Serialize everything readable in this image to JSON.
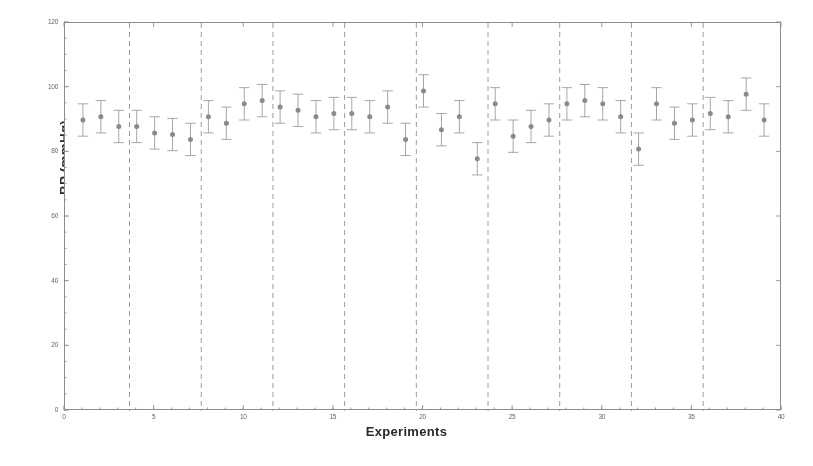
{
  "chart_data": {
    "type": "scatter",
    "title": "",
    "subtitle": "",
    "xlabel": "Experiments",
    "ylabel": "BP (mmHg)",
    "xlim": [
      0,
      40
    ],
    "ylim": [
      0,
      120
    ],
    "xticks": [
      0,
      5,
      10,
      15,
      20,
      25,
      30,
      35,
      40
    ],
    "yticks": [
      0,
      20,
      40,
      60,
      80,
      100,
      120
    ],
    "xtick_labels": [
      "0",
      "5",
      "10",
      "15",
      "20",
      "25",
      "30",
      "35",
      "40"
    ],
    "ytick_labels": [
      "0",
      "20",
      "40",
      "60",
      "80",
      "100",
      "120"
    ],
    "grid": false,
    "legend": null,
    "legend_position": "none",
    "marker": "filled-circle-with-errorbar",
    "marker_color": "#8a8a8a",
    "errorbar_color": "#9a9a9a",
    "group_divider_color": "#9a9a9a",
    "group_divider_style": "dashed",
    "group_dividers_x": [
      3.6,
      7.6,
      11.6,
      15.6,
      19.6,
      23.6,
      27.6,
      31.6,
      35.6
    ],
    "series": [
      {
        "name": "BP mean with error bars",
        "x": [
          1,
          2,
          3,
          4,
          5,
          6,
          7,
          8,
          9,
          10,
          11,
          12,
          13,
          14,
          15,
          16,
          17,
          18,
          19,
          20,
          21,
          22,
          23,
          24,
          25,
          26,
          27,
          28,
          29,
          30,
          31,
          32,
          33,
          34,
          35,
          36,
          37,
          38,
          39
        ],
        "values": [
          90,
          91,
          88,
          88,
          86,
          85.5,
          84,
          91,
          89,
          95,
          96,
          94,
          93,
          91,
          92,
          92,
          91,
          94,
          84,
          99,
          87,
          91,
          78,
          95,
          85,
          88,
          90,
          95,
          96,
          95,
          91,
          81,
          95,
          89,
          90,
          92,
          91,
          98,
          90
        ],
        "err_low": [
          5,
          5,
          5,
          5,
          5,
          5,
          5,
          5,
          5,
          5,
          5,
          5,
          5,
          5,
          5,
          5,
          5,
          5,
          5,
          5,
          5,
          5,
          5,
          5,
          5,
          5,
          5,
          5,
          5,
          5,
          5,
          5,
          5,
          5,
          5,
          5,
          5,
          5,
          5
        ],
        "err_high": [
          5,
          5,
          5,
          5,
          5,
          5,
          5,
          5,
          5,
          5,
          5,
          5,
          5,
          5,
          5,
          5,
          5,
          5,
          5,
          5,
          5,
          5,
          5,
          5,
          5,
          5,
          5,
          5,
          5,
          5,
          5,
          5,
          5,
          5,
          5,
          5,
          5,
          5,
          5
        ]
      }
    ]
  }
}
